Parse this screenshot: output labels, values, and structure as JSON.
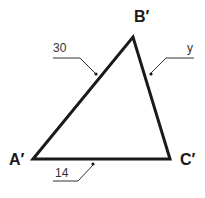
{
  "diagram": {
    "vertices": {
      "A": {
        "label": "A′",
        "x": 33,
        "y": 159
      },
      "B": {
        "label": "B′",
        "x": 133,
        "y": 37
      },
      "C": {
        "label": "C′",
        "x": 170,
        "y": 159
      }
    },
    "sides": {
      "AB": {
        "label": "30"
      },
      "BC": {
        "label": "y"
      },
      "AC": {
        "label": "14"
      }
    },
    "colors": {
      "stroke": "#1a1a1a",
      "leader": "#333333",
      "background": "#ffffff"
    }
  }
}
